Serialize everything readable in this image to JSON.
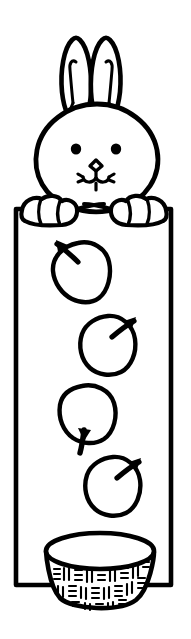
{
  "page": {
    "style": "black-and-white line art",
    "background_color": "#ffffff",
    "ink_color": "#000000",
    "width": 191,
    "height": 639
  },
  "artwork": {
    "subject_label": "bunny holding a sign",
    "character": {
      "name": "bunny",
      "label": "Bunny",
      "ear_count": 2,
      "eye_count": 2,
      "paw_count": 2,
      "features": [
        {
          "name": "left-ear",
          "label": "Left ear"
        },
        {
          "name": "right-ear",
          "label": "Right ear"
        },
        {
          "name": "left-eye",
          "label": "Left eye"
        },
        {
          "name": "right-eye",
          "label": "Right eye"
        },
        {
          "name": "nose",
          "label": "Nose"
        },
        {
          "name": "mouth",
          "label": "Mouth"
        },
        {
          "name": "left-paw",
          "label": "Left paw"
        },
        {
          "name": "right-paw",
          "label": "Right paw"
        }
      ]
    },
    "sign": {
      "name": "blank-sign",
      "label": "Blank rectangular sign",
      "shape": "rectangle",
      "fill": "#ffffff"
    },
    "apples": [
      {
        "index": 1,
        "label": "Apple 1",
        "stem_direction": "up-left"
      },
      {
        "index": 2,
        "label": "Apple 2",
        "stem_direction": "up-right"
      },
      {
        "index": 3,
        "label": "Apple 3",
        "stem_direction": "down"
      },
      {
        "index": 4,
        "label": "Apple 4",
        "stem_direction": "up-right"
      }
    ],
    "apple_count": 4,
    "basket": {
      "name": "woven-basket",
      "label": "Woven basket",
      "texture": "hatched weave",
      "weave_row_count": 3
    }
  }
}
